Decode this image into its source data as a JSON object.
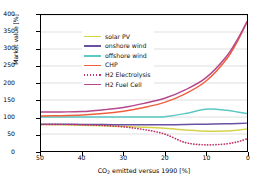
{
  "chart_data": {
    "type": "line",
    "title": "",
    "xlabel": "CO2 emitted versus 1990 [%]",
    "xlabel_main": "CO",
    "xlabel_sub": "2",
    "xlabel_rest": " emitted versus 1990 [%]",
    "ylabel": "Market value [%]",
    "xlim": [
      50,
      0
    ],
    "ylim": [
      0,
      400
    ],
    "x_inverted": true,
    "grid": true,
    "grid_axis": "y",
    "legend_position": "upper-left",
    "xticks": [
      50,
      40,
      30,
      20,
      10,
      0
    ],
    "yticks": [
      0,
      50,
      100,
      150,
      200,
      250,
      300,
      350,
      400
    ],
    "x": [
      50,
      45,
      40,
      35,
      30,
      25,
      20,
      15,
      10,
      5,
      2,
      0
    ],
    "series": [
      {
        "name": "solar PV",
        "label": "solar PV",
        "color": "#d5d34a",
        "style": "solid",
        "values": [
          78,
          77,
          76,
          74,
          72,
          70,
          67,
          62,
          58,
          59,
          62,
          65
        ]
      },
      {
        "name": "onshore wind",
        "label": "onshore wind",
        "color": "#6a4fa3",
        "style": "solid",
        "values": [
          79,
          79,
          78,
          78,
          77,
          77,
          77,
          78,
          79,
          80,
          81,
          82
        ]
      },
      {
        "name": "offshore wind",
        "label": "offshore wind",
        "color": "#5bc8c4",
        "style": "solid",
        "values": [
          100,
          100,
          100,
          100,
          100,
          100,
          101,
          110,
          123,
          120,
          114,
          110
        ]
      },
      {
        "name": "CHP",
        "label": "CHP",
        "color": "#f0603f",
        "style": "solid",
        "values": [
          103,
          104,
          106,
          110,
          117,
          128,
          143,
          168,
          205,
          270,
          330,
          380
        ]
      },
      {
        "name": "H2 Electrolysis",
        "label": "H2 Electrolysis",
        "color": "#c0346b",
        "style": "dotted",
        "values": [
          78,
          78,
          77,
          75,
          71,
          63,
          50,
          25,
          18,
          21,
          28,
          36
        ]
      },
      {
        "name": "H2 Fuel Cell",
        "label": "H2 Fuel Cell",
        "color": "#b5478c",
        "style": "solid",
        "values": [
          115,
          115,
          116,
          121,
          128,
          140,
          155,
          180,
          215,
          278,
          335,
          380
        ]
      }
    ]
  }
}
